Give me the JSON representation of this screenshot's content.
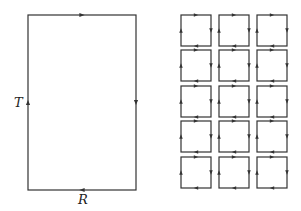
{
  "diagram": {
    "big_loop": {
      "label_left": "T",
      "label_bottom": "R",
      "orientation": "clockwise",
      "rect": {
        "x": 28,
        "y": 15,
        "w": 108,
        "h": 175
      }
    },
    "small_loops": {
      "rows": 5,
      "cols": 3,
      "orientation": "clockwise",
      "origin_x": [
        181,
        219,
        257
      ],
      "origin_y": [
        15,
        50,
        86,
        121,
        157
      ],
      "size": 30
    },
    "line_color": "#333333"
  }
}
